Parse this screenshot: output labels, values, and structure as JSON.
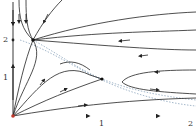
{
  "diagram": {
    "type": "phase-portrait",
    "axes": {
      "x_ticks": [
        "1",
        "2"
      ],
      "y_ticks": [
        "1",
        "2"
      ]
    },
    "fixed_points": [
      {
        "name": "origin",
        "x": 0,
        "y": 0,
        "color": "#c0392b"
      },
      {
        "name": "stable-node",
        "x": 0.22,
        "y": 2.0
      },
      {
        "name": "saddle",
        "x": 1.0,
        "y": 1.0
      }
    ],
    "colors": {
      "trajectory": "#222222",
      "nullcline": "#6a8aa8",
      "x_axis_flow": "#5b8fd6",
      "origin": "#c0392b"
    }
  }
}
